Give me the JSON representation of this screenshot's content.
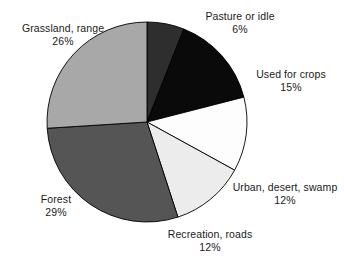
{
  "chart_data": {
    "type": "pie",
    "title": "",
    "subtitle": "",
    "xlabel": "",
    "ylabel": "",
    "legend_position": "none",
    "grid": false,
    "units": "percent",
    "start_angle_deg": 0,
    "direction": "clockwise",
    "center": {
      "x": 147,
      "y": 122
    },
    "radius": 100,
    "categories": [
      "Pasture or idle",
      "Used for crops",
      "Urban, desert, swamp",
      "Recreation, roads",
      "Forest",
      "Grassland, range"
    ],
    "values": [
      6,
      15,
      12,
      12,
      29,
      26
    ],
    "slices": [
      {
        "label": "Pasture or idle",
        "value": 6,
        "percent_text": "6%",
        "color": "#2e2e2e",
        "stroke": "#000000"
      },
      {
        "label": "Used for crops",
        "value": 15,
        "percent_text": "15%",
        "color": "#0a0a0a",
        "stroke": "#000000"
      },
      {
        "label": "Urban, desert, swamp",
        "value": 12,
        "percent_text": "12%",
        "color": "#fdfdfd",
        "stroke": "#000000"
      },
      {
        "label": "Recreation, roads",
        "value": 12,
        "percent_text": "12%",
        "color": "#ececec",
        "stroke": "#000000"
      },
      {
        "label": "Forest",
        "value": 29,
        "percent_text": "29%",
        "color": "#555555",
        "stroke": "#000000"
      },
      {
        "label": "Grassland, range",
        "value": 26,
        "percent_text": "26%",
        "color": "#a8a8a8",
        "stroke": "#000000"
      }
    ],
    "background_color": "#ffffff",
    "text_color": "#1a1a1a"
  }
}
